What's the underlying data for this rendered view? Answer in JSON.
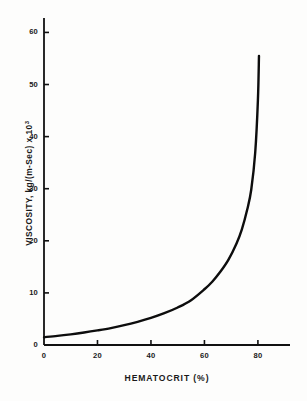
{
  "chart_data": {
    "type": "line",
    "title": "",
    "xlabel": "HEMATOCRIT  (%)",
    "ylabel_main": "VISCOSITY,  kg/(m-Sec) x 10",
    "ylabel_exponent": "3",
    "ylabel_full": "VISCOSITY, kg/(m-Sec) x 10^3",
    "xlim": [
      0,
      92
    ],
    "ylim": [
      0,
      62
    ],
    "xticks": [
      0,
      20,
      40,
      60,
      80
    ],
    "yticks": [
      0,
      10,
      20,
      30,
      40,
      50,
      60
    ],
    "xtick_labels": [
      "0",
      "20",
      "40",
      "60",
      "80"
    ],
    "ytick_labels": [
      "0",
      "10",
      "20",
      "30",
      "40",
      "50",
      "60"
    ],
    "grid": false,
    "legend": false,
    "legend_position": "none",
    "line_color": "#0d0d0d",
    "line_width_px": 2.4,
    "series": [
      {
        "name": "Blood viscosity",
        "x": [
          0,
          5,
          10,
          15,
          20,
          25,
          30,
          35,
          40,
          45,
          50,
          55,
          60,
          63,
          66,
          69,
          72,
          74,
          76,
          77.5,
          79,
          80,
          80.4
        ],
        "values": [
          1.5,
          1.75,
          2.05,
          2.4,
          2.8,
          3.25,
          3.8,
          4.45,
          5.2,
          6.1,
          7.2,
          8.6,
          10.7,
          12.2,
          14.1,
          16.4,
          19.5,
          22.2,
          26.0,
          29.8,
          37.0,
          47.0,
          55.5
        ]
      }
    ],
    "annotations": []
  },
  "figure": {
    "background": "#fdfdfc",
    "axis_color": "#111111",
    "axes_style": "left-and-bottom-spines"
  }
}
